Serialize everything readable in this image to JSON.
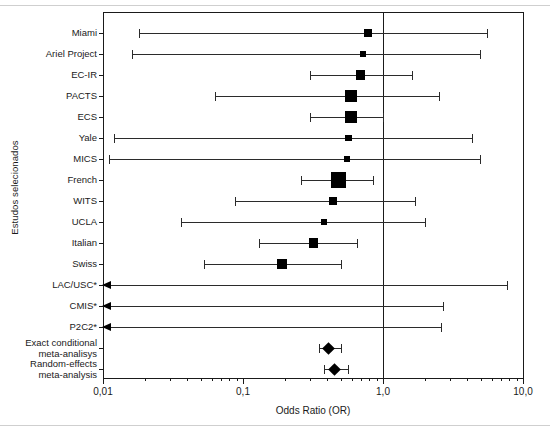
{
  "chart_data": {
    "type": "scatter",
    "subtype": "forest-plot",
    "title": "",
    "xlabel": "Odds Ratio (OR)",
    "ylabel": "Estudos selecionados",
    "xscale": "log",
    "xlim": [
      0.01,
      10.0
    ],
    "xticks": [
      0.01,
      0.1,
      1.0,
      10.0
    ],
    "xticklabels": [
      "0,01",
      "0,1",
      "1,0",
      "10,0"
    ],
    "grid": false,
    "legend": false,
    "null_line": 1.0,
    "footnote_marker": "*",
    "rows": [
      {
        "label": "Miami",
        "or": 0.78,
        "lo": 0.018,
        "hi": 5.5,
        "weight": 0.3,
        "kind": "study"
      },
      {
        "label": "Ariel Project",
        "or": 0.72,
        "lo": 0.016,
        "hi": 4.9,
        "weight": 0.22,
        "kind": "study"
      },
      {
        "label": "EC-IR",
        "or": 0.69,
        "lo": 0.3,
        "hi": 1.6,
        "weight": 0.5,
        "kind": "study"
      },
      {
        "label": "PACTS",
        "or": 0.59,
        "lo": 0.063,
        "hi": 2.5,
        "weight": 0.7,
        "kind": "study"
      },
      {
        "label": "ECS",
        "or": 0.59,
        "lo": 0.3,
        "hi": 1.0,
        "weight": 0.65,
        "kind": "study"
      },
      {
        "label": "Yale",
        "or": 0.57,
        "lo": 0.012,
        "hi": 4.3,
        "weight": 0.25,
        "kind": "study"
      },
      {
        "label": "MICS",
        "or": 0.55,
        "lo": 0.011,
        "hi": 4.9,
        "weight": 0.2,
        "kind": "study"
      },
      {
        "label": "French",
        "or": 0.48,
        "lo": 0.26,
        "hi": 0.85,
        "weight": 1.0,
        "kind": "study"
      },
      {
        "label": "WITS",
        "or": 0.44,
        "lo": 0.088,
        "hi": 1.7,
        "weight": 0.42,
        "kind": "study"
      },
      {
        "label": "UCLA",
        "or": 0.38,
        "lo": 0.036,
        "hi": 2.0,
        "weight": 0.22,
        "kind": "study"
      },
      {
        "label": "Italian",
        "or": 0.32,
        "lo": 0.13,
        "hi": 0.65,
        "weight": 0.48,
        "kind": "study"
      },
      {
        "label": "Swiss",
        "or": 0.19,
        "lo": 0.053,
        "hi": 0.5,
        "weight": 0.52,
        "kind": "study"
      },
      {
        "label": "LAC/USC*",
        "or": null,
        "lo": 0.01,
        "hi": 7.7,
        "weight": 0,
        "kind": "arrow"
      },
      {
        "label": "CMIS*",
        "or": null,
        "lo": 0.01,
        "hi": 2.7,
        "weight": 0,
        "kind": "arrow"
      },
      {
        "label": "P2C2*",
        "or": null,
        "lo": 0.01,
        "hi": 2.6,
        "weight": 0,
        "kind": "arrow"
      },
      {
        "label": "Exact conditional\nmeta-analisys",
        "or": 0.41,
        "lo": 0.35,
        "hi": 0.5,
        "weight": 0,
        "kind": "summary"
      },
      {
        "label": "Random-effects\nmeta-analysis",
        "or": 0.45,
        "lo": 0.38,
        "hi": 0.56,
        "weight": 0,
        "kind": "summary"
      }
    ]
  },
  "colors": {
    "axis": "#1a1a1a",
    "marker": "#000000",
    "ci": "#2b2b2b",
    "rule": "#cfcfcf",
    "background": "#ffffff"
  }
}
